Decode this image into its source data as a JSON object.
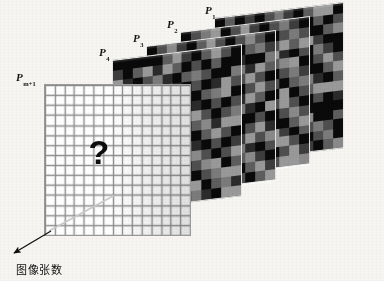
{
  "figure": {
    "type": "diagram",
    "background_color": "#f6f5f2",
    "width": 384,
    "height": 281
  },
  "labels": {
    "p1": {
      "base": "P",
      "sub": "1"
    },
    "p2": {
      "base": "P",
      "sub": "2"
    },
    "p3": {
      "base": "P",
      "sub": "3"
    },
    "p4": {
      "base": "P",
      "sub": "4"
    },
    "p_front": {
      "base": "P",
      "sub": "m+1"
    }
  },
  "front_panel": {
    "question_mark": "?",
    "grid_cols": 15,
    "grid_rows": 15,
    "line_color": "#8e8e8e",
    "fill_color": "#ffffff"
  },
  "axis": {
    "caption": "图像张数",
    "arrow_color": "#101010",
    "direction": "down-left"
  },
  "panels": [
    {
      "name": "P1",
      "label_key": "p1",
      "x": 214,
      "y": 18,
      "w": 130,
      "h": 146,
      "skew_deg": -7,
      "seed": 11,
      "label_x": 205,
      "label_y": 4
    },
    {
      "name": "P2",
      "label_key": "p2",
      "x": 180,
      "y": 32,
      "w": 130,
      "h": 148,
      "skew_deg": -7,
      "seed": 23,
      "label_x": 167,
      "label_y": 18
    },
    {
      "name": "P3",
      "label_key": "p3",
      "x": 146,
      "y": 46,
      "w": 130,
      "h": 150,
      "skew_deg": -7,
      "seed": 37,
      "label_x": 133,
      "label_y": 32
    },
    {
      "name": "P4",
      "label_key": "p4",
      "x": 112,
      "y": 60,
      "w": 130,
      "h": 152,
      "skew_deg": -7,
      "seed": 53,
      "label_x": 99,
      "label_y": 46
    }
  ],
  "front_panel_box": {
    "name": "P_m+1",
    "label_key": "p_front",
    "x": 44,
    "y": 84,
    "w": 147,
    "h": 152,
    "label_x": 16,
    "label_y": 71
  },
  "palette": {
    "gray_levels": [
      "#0a0a0a",
      "#2b2b2b",
      "#3d3d3d",
      "#4f4f4f",
      "#5e5e5e",
      "#6d6d6d",
      "#7b7b7b",
      "#8a8a8a",
      "#999999"
    ],
    "panel_border": "#e8e8e6",
    "grid_line": "#8e8e8e",
    "ink": "#101010"
  }
}
